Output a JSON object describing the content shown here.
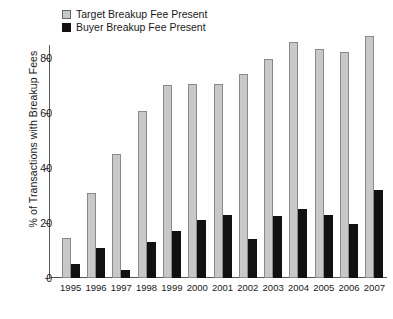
{
  "chart_data": {
    "type": "bar",
    "title": "",
    "xlabel": "",
    "ylabel": "% of Transactions with Breakup Fees",
    "ylim": [
      0,
      90
    ],
    "yticks": [
      0,
      20,
      40,
      60,
      80
    ],
    "grid": false,
    "legend_position": "top-left",
    "categories": [
      "1995",
      "1996",
      "1997",
      "1998",
      "1999",
      "2000",
      "2001",
      "2002",
      "2003",
      "2004",
      "2005",
      "2006",
      "2007"
    ],
    "series": [
      {
        "name": "Target Breakup Fee Present",
        "color": "#c8c8c8",
        "values": [
          14.5,
          31,
          45,
          60.5,
          70,
          70.5,
          70.5,
          74,
          79.5,
          85.5,
          83,
          82,
          88
        ]
      },
      {
        "name": "Buyer Breakup Fee Present",
        "color": "#111111",
        "values": [
          5,
          11,
          3,
          13,
          17,
          21,
          23,
          14,
          22.5,
          25,
          23,
          19.5,
          32
        ]
      }
    ]
  }
}
